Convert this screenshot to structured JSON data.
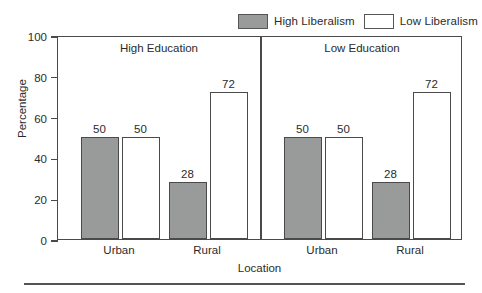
{
  "chart_data": {
    "type": "bar",
    "title": "",
    "xlabel": "Location",
    "ylabel": "Percentage",
    "ylim": [
      0,
      100
    ],
    "yticks": [
      0,
      20,
      40,
      60,
      80,
      100
    ],
    "grid": false,
    "legend_position": "top-right",
    "categories": [
      "Urban",
      "Rural"
    ],
    "panels": [
      {
        "title": "High Education",
        "categories": [
          "Urban",
          "Rural"
        ],
        "series": [
          {
            "name": "High Liberalism",
            "values": [
              50,
              28
            ]
          },
          {
            "name": "Low Liberalism",
            "values": [
              50,
              72
            ]
          }
        ]
      },
      {
        "title": "Low Education",
        "categories": [
          "Urban",
          "Rural"
        ],
        "series": [
          {
            "name": "High Liberalism",
            "values": [
              50,
              28
            ]
          },
          {
            "name": "Low Liberalism",
            "values": [
              50,
              72
            ]
          }
        ]
      }
    ],
    "series_colors": {
      "High Liberalism": "#999a9a",
      "Low Liberalism": "#ffffff"
    }
  },
  "legend": {
    "entries": [
      {
        "label": "High Liberalism",
        "swatch": "filled"
      },
      {
        "label": "Low Liberalism",
        "swatch": "empty"
      }
    ]
  },
  "axes": {
    "y_title": "Percentage",
    "x_title": "Location",
    "y_tick_labels": [
      "0",
      "20",
      "40",
      "60",
      "80",
      "100"
    ],
    "x_tick_labels": [
      "Urban",
      "Rural",
      "Urban",
      "Rural"
    ]
  },
  "panel_titles": [
    "High Education",
    "Low Education"
  ],
  "bar_labels": [
    "50",
    "50",
    "28",
    "72",
    "50",
    "50",
    "28",
    "72"
  ],
  "colors": {
    "bar_fill_high": "#999a9a",
    "bar_fill_low": "#ffffff",
    "outline": "#4a4a4a",
    "text": "#2b2b2b",
    "background": "#ffffff"
  }
}
